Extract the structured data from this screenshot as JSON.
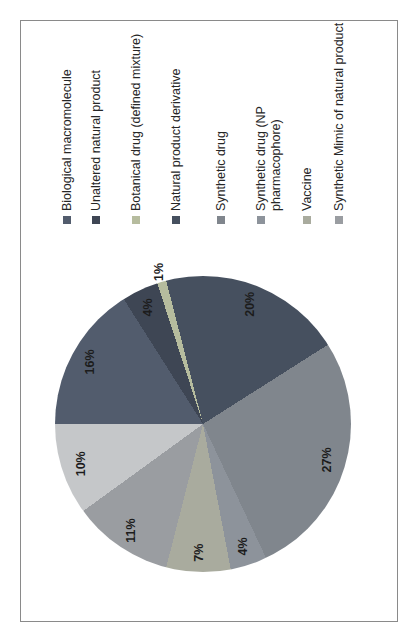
{
  "figure": {
    "background": "#ffffff",
    "border_color": "#8a8a8a"
  },
  "chart_data": {
    "type": "pie",
    "title": "",
    "legend_position": "right",
    "layout_hints": {
      "whole_figure_rotation": "90deg counterclockwise",
      "start_angle_deg": 0,
      "direction": "clockwise",
      "grid": "off"
    },
    "slices": [
      {
        "label": "Biological macromolecule",
        "label_lines": [
          "Biological macromolecule"
        ],
        "value": 16,
        "data_label": "16%",
        "color": "#525c6d",
        "in_legend": true
      },
      {
        "label": "Unaltered natural product",
        "label_lines": [
          "Unaltered natural product"
        ],
        "value": 4,
        "data_label": "4%",
        "color": "#3e4654",
        "in_legend": true
      },
      {
        "label": "Botanical drug (defined mixture)",
        "label_lines": [
          "Botanical drug (defined mixture)"
        ],
        "value": 1,
        "data_label": "1%",
        "color": "#b6bc9e",
        "in_legend": true
      },
      {
        "label": "Natural product derivative",
        "label_lines": [
          "Natural product derivative"
        ],
        "value": 20,
        "data_label": "20%",
        "color": "#46505f",
        "in_legend": true
      },
      {
        "label": "Synthetic drug",
        "label_lines": [
          "Synthetic drug"
        ],
        "value": 27,
        "data_label": "27%",
        "color": "#80868d",
        "in_legend": true
      },
      {
        "label": "Synthetic drug (NP pharmacophore)",
        "label_lines": [
          "Synthetic drug (NP",
          "pharmacophore)"
        ],
        "value": 4,
        "data_label": "4%",
        "color": "#8d939b",
        "in_legend": true
      },
      {
        "label": "Vaccine",
        "label_lines": [
          "Vaccine"
        ],
        "value": 7,
        "data_label": "7%",
        "color": "#a9ab9e",
        "in_legend": true
      },
      {
        "label": "Synthetic Mimic of natural product",
        "label_lines": [
          "Synthetic Mimic of natural product"
        ],
        "value": 11,
        "data_label": "11%",
        "color": "#9a9da1",
        "in_legend": true
      },
      {
        "label": "",
        "label_lines": [],
        "value": 10,
        "data_label": "10%",
        "color": "#c5c7c9",
        "in_legend": false
      }
    ]
  }
}
